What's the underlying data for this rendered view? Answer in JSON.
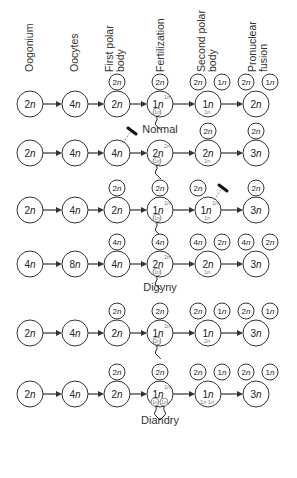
{
  "columns": [
    {
      "lines": [
        "Oogonium"
      ],
      "x": 24
    },
    {
      "lines": [
        "Oocytes"
      ],
      "x": 69
    },
    {
      "lines": [
        "First polar",
        "body"
      ],
      "x": 104
    },
    {
      "lines": [
        "Fertilization"
      ],
      "x": 155
    },
    {
      "lines": [
        "Second polar",
        "body"
      ],
      "x": 196
    },
    {
      "lines": [
        "Pronuclear",
        "fusion"
      ],
      "x": 247
    }
  ],
  "column_x": [
    30,
    75,
    117,
    160,
    208,
    256
  ],
  "rows": [
    {
      "y": 104,
      "cells": [
        {
          "label": "2n"
        },
        {
          "label": "4n"
        },
        {
          "label": "2n",
          "polar": [
            {
              "label": "2n",
              "dx": 0
            }
          ]
        },
        {
          "label": "1n",
          "sup": "1n",
          "inner": [
            {
              "label": "1n"
            }
          ],
          "polar": [
            {
              "label": "2n",
              "dx": 0
            }
          ],
          "sperm": [
            {
              "dx": -8
            }
          ]
        },
        {
          "label": "1n",
          "sub": "1n",
          "polar": [
            {
              "label": "2n",
              "dx": -10
            },
            {
              "label": "1n",
              "dx": 14
            }
          ]
        },
        {
          "label": "2n",
          "polar": [
            {
              "label": "2n",
              "dx": -10
            },
            {
              "label": "1n",
              "dx": 14
            }
          ]
        }
      ],
      "caption": "Normal",
      "caption_y": 130
    },
    {
      "y": 153,
      "cells": [
        {
          "label": "2n"
        },
        {
          "label": "4n"
        },
        {
          "label": "4n",
          "blocked_polar": true
        },
        {
          "label": "2n",
          "sup": "2n",
          "inner": [
            {
              "label": "1n"
            }
          ],
          "sperm": [
            {
              "dx": -8
            }
          ]
        },
        {
          "label": "2n",
          "sub": "1n",
          "polar": [
            {
              "label": "2n",
              "dx": 0
            }
          ]
        },
        {
          "label": "3n",
          "polar": [
            {
              "label": "2n",
              "dx": 0
            }
          ]
        }
      ]
    },
    {
      "y": 210,
      "cells": [
        {
          "label": "2n"
        },
        {
          "label": "4n"
        },
        {
          "label": "2n",
          "polar": [
            {
              "label": "2n",
              "dx": 0
            }
          ]
        },
        {
          "label": "1n",
          "sup": "1n",
          "inner": [
            {
              "label": "1n"
            }
          ],
          "polar": [
            {
              "label": "2n",
              "dx": 0
            }
          ],
          "sperm": [
            {
              "dx": -8
            }
          ]
        },
        {
          "label": "1n",
          "sup": "1n",
          "sub": "1n",
          "polar": [
            {
              "label": "2n",
              "dx": -10
            }
          ],
          "blocked_polar": true
        },
        {
          "label": "3n",
          "polar": [
            {
              "label": "2n",
              "dx": 0
            }
          ]
        }
      ]
    },
    {
      "y": 264,
      "cells": [
        {
          "label": "4n"
        },
        {
          "label": "8n"
        },
        {
          "label": "4n",
          "polar": [
            {
              "label": "4n",
              "dx": 0
            }
          ]
        },
        {
          "label": "2n",
          "sup": "2n",
          "inner": [
            {
              "label": "1n"
            }
          ],
          "polar": [
            {
              "label": "4n",
              "dx": 0
            }
          ],
          "sperm": [
            {
              "dx": -8
            }
          ]
        },
        {
          "label": "2n",
          "sub": "1n",
          "polar": [
            {
              "label": "4n",
              "dx": -10
            },
            {
              "label": "2n",
              "dx": 14
            }
          ]
        },
        {
          "label": "3n",
          "polar": [
            {
              "label": "4n",
              "dx": -10
            },
            {
              "label": "2n",
              "dx": 14
            }
          ]
        }
      ],
      "caption": "Digyny",
      "caption_y": 288
    },
    {
      "y": 333,
      "cells": [
        {
          "label": "2n"
        },
        {
          "label": "4n"
        },
        {
          "label": "2n",
          "polar": [
            {
              "label": "2n",
              "dx": 0
            }
          ]
        },
        {
          "label": "1n",
          "sup": "1n",
          "inner": [
            {
              "label": "2n"
            }
          ],
          "polar": [
            {
              "label": "2n",
              "dx": 0
            }
          ],
          "sperm": [
            {
              "dx": -8
            }
          ]
        },
        {
          "label": "1n",
          "sub": "2n",
          "polar": [
            {
              "label": "2n",
              "dx": -10
            },
            {
              "label": "1n",
              "dx": 14
            }
          ]
        },
        {
          "label": "3n",
          "polar": [
            {
              "label": "2n",
              "dx": -10
            },
            {
              "label": "1n",
              "dx": 14
            }
          ]
        }
      ]
    },
    {
      "y": 394,
      "cells": [
        {
          "label": "2n"
        },
        {
          "label": "4n"
        },
        {
          "label": "2n",
          "polar": [
            {
              "label": "2n",
              "dx": 0
            }
          ]
        },
        {
          "label": "1n",
          "sup": "1n",
          "inner": [
            {
              "label": "1n"
            },
            {
              "label": "1n"
            }
          ],
          "polar": [
            {
              "label": "2n",
              "dx": 0
            }
          ],
          "sperm": [
            {
              "dx": -10
            },
            {
              "dx": 10
            }
          ]
        },
        {
          "label": "1n",
          "sub": "1n 1n",
          "polar": [
            {
              "label": "2n",
              "dx": -10
            },
            {
              "label": "1n",
              "dx": 14
            }
          ]
        },
        {
          "label": "3n",
          "polar": [
            {
              "label": "2n",
              "dx": -10
            },
            {
              "label": "1n",
              "dx": 14
            }
          ]
        }
      ],
      "caption": "Diandry",
      "caption_y": 421
    }
  ],
  "colors": {
    "stroke": "#333333",
    "text": "#222222",
    "inner": "#777777"
  }
}
